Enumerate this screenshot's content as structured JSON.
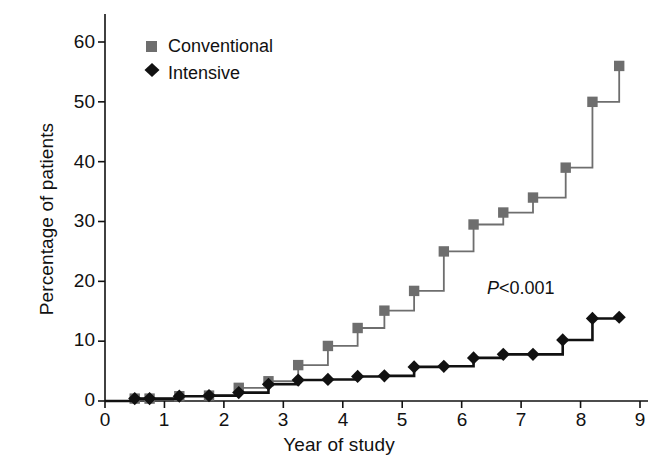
{
  "chart_data": {
    "type": "line",
    "title": "",
    "xlabel": "Year of study",
    "ylabel": "Percentage of patients",
    "xlim": [
      0,
      9
    ],
    "ylim": [
      0,
      63
    ],
    "xticks": [
      0,
      1,
      2,
      3,
      4,
      5,
      6,
      7,
      8,
      9
    ],
    "yticks": [
      0,
      10,
      20,
      30,
      40,
      50,
      60
    ],
    "grid": false,
    "legend_position": "top-left",
    "step_style": "post",
    "annotations": [
      {
        "text": "P<0.001",
        "italic_prefix": "P",
        "rest": "<0.001",
        "x": 6.75,
        "y": 18.5
      }
    ],
    "series": [
      {
        "name": "Conventional",
        "color": "#6e6e6e",
        "marker": "square",
        "x": [
          0.5,
          0.75,
          1.25,
          1.75,
          2.25,
          2.75,
          3.25,
          3.75,
          4.25,
          4.7,
          5.2,
          5.7,
          6.2,
          6.7,
          7.2,
          7.75,
          8.2,
          8.65
        ],
        "y": [
          0.4,
          0.4,
          0.8,
          0.9,
          2.2,
          3.3,
          6.0,
          9.2,
          12.2,
          15.1,
          18.4,
          25.0,
          29.5,
          31.5,
          34.0,
          39.0,
          50.0,
          56.0
        ]
      },
      {
        "name": "Intensive",
        "color": "#111111",
        "marker": "diamond",
        "x": [
          0.5,
          0.75,
          1.25,
          1.75,
          2.25,
          2.75,
          3.25,
          3.75,
          4.25,
          4.7,
          5.2,
          5.7,
          6.2,
          6.7,
          7.2,
          7.7,
          8.2,
          8.65
        ],
        "y": [
          0.4,
          0.4,
          0.8,
          0.9,
          1.4,
          2.8,
          3.5,
          3.6,
          4.1,
          4.2,
          5.7,
          5.8,
          7.2,
          7.8,
          7.8,
          10.2,
          13.8,
          14.0
        ]
      }
    ]
  },
  "legend": {
    "items": [
      {
        "label": "Conventional",
        "marker": "square",
        "color": "#6e6e6e"
      },
      {
        "label": "Intensive",
        "marker": "diamond",
        "color": "#111111"
      }
    ]
  },
  "axes": {
    "y_title": "Percentage of patients",
    "x_title": "Year of study",
    "y_tick_labels": [
      "60",
      "50",
      "40",
      "30",
      "20",
      "10",
      "0"
    ],
    "x_tick_labels": [
      "0",
      "1",
      "2",
      "3",
      "4",
      "5",
      "6",
      "7",
      "8",
      "9"
    ]
  }
}
